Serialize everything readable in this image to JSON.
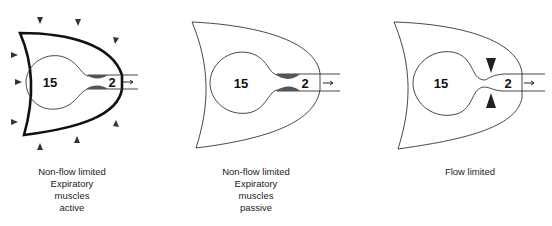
{
  "panels": [
    {
      "id": "active",
      "alveolar_pressure": "15",
      "airway_pressure": "2",
      "caption_lines": [
        "Non-flow limited",
        "Expiratory",
        "muscles",
        "active"
      ],
      "chest_wall": "thick",
      "external_force_arrows": true,
      "airway_compression": "dark-shaded-narrowing"
    },
    {
      "id": "passive",
      "alveolar_pressure": "15",
      "airway_pressure": "2",
      "caption_lines": [
        "Non-flow limited",
        "Expiratory",
        "muscles",
        "passive"
      ],
      "chest_wall": "thin",
      "external_force_arrows": false,
      "airway_compression": "dark-shaded-narrowing"
    },
    {
      "id": "flow-limited",
      "alveolar_pressure": "15",
      "airway_pressure": "2",
      "caption_lines": [
        "Flow limited"
      ],
      "chest_wall": "thin",
      "external_force_arrows": false,
      "airway_compression": "collapse-arrowheads"
    }
  ],
  "colors": {
    "line": "#222222",
    "shade": "#555555",
    "background": "#ffffff"
  }
}
